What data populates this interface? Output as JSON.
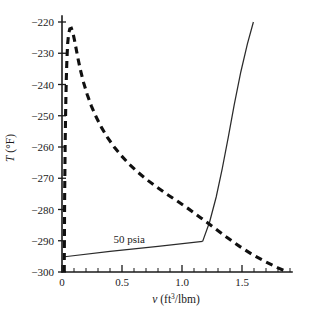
{
  "chart_data": {
    "type": "line",
    "title": "",
    "xlabel": "v (ft3/lbm)",
    "xlabel_base": "v (ft",
    "xlabel_sup": "3",
    "xlabel_tail": "/lbm)",
    "ylabel": "T (°F)",
    "xlim": [
      0,
      1.9
    ],
    "ylim": [
      -300,
      -218
    ],
    "grid": false,
    "legend": "none",
    "x_ticks_major": [
      0,
      0.5,
      1.0,
      1.5
    ],
    "x_tick_labels": [
      "0",
      "0.5",
      "1.0",
      "1.5"
    ],
    "x_tick_minor_step": 0.1,
    "y_ticks_major": [
      -220,
      -230,
      -240,
      -250,
      -260,
      -270,
      -280,
      -290,
      -300
    ],
    "y_tick_labels": [
      "−220",
      "−230",
      "−240",
      "−250",
      "−260",
      "−270",
      "−280",
      "−290",
      "−300"
    ],
    "annotations": [
      {
        "text": "50 psia",
        "x": 0.56,
        "y": -290.6
      }
    ],
    "series": [
      {
        "name": "saturation dome (saturated liquid + vapor line)",
        "style": "dashed",
        "points": [
          [
            0.019,
            -300.0
          ],
          [
            0.019,
            -296.0
          ],
          [
            0.02,
            -290.0
          ],
          [
            0.021,
            -283.0
          ],
          [
            0.022,
            -276.0
          ],
          [
            0.024,
            -268.0
          ],
          [
            0.026,
            -260.0
          ],
          [
            0.029,
            -252.0
          ],
          [
            0.032,
            -245.0
          ],
          [
            0.036,
            -238.0
          ],
          [
            0.041,
            -232.0
          ],
          [
            0.047,
            -227.0
          ],
          [
            0.055,
            -223.8
          ],
          [
            0.065,
            -222.2
          ],
          [
            0.078,
            -222.0
          ],
          [
            0.09,
            -223.3
          ],
          [
            0.103,
            -225.6
          ],
          [
            0.118,
            -228.6
          ],
          [
            0.135,
            -232.0
          ],
          [
            0.155,
            -235.6
          ],
          [
            0.18,
            -239.4
          ],
          [
            0.21,
            -243.2
          ],
          [
            0.245,
            -246.9
          ],
          [
            0.285,
            -250.4
          ],
          [
            0.33,
            -253.8
          ],
          [
            0.38,
            -257.0
          ],
          [
            0.435,
            -260.0
          ],
          [
            0.495,
            -262.8
          ],
          [
            0.56,
            -265.5
          ],
          [
            0.63,
            -268.0
          ],
          [
            0.705,
            -270.4
          ],
          [
            0.785,
            -272.7
          ],
          [
            0.87,
            -275.0
          ],
          [
            0.96,
            -277.3
          ],
          [
            1.055,
            -279.8
          ],
          [
            1.155,
            -282.6
          ],
          [
            1.26,
            -285.6
          ],
          [
            1.37,
            -288.8
          ],
          [
            1.48,
            -291.8
          ],
          [
            1.59,
            -294.5
          ],
          [
            1.7,
            -296.8
          ],
          [
            1.8,
            -298.7
          ],
          [
            1.88,
            -300.0
          ]
        ]
      },
      {
        "name": "50 psia constant-pressure line",
        "style": "solid",
        "points": [
          [
            0.022,
            -295.1
          ],
          [
            0.4,
            -293.4
          ],
          [
            0.8,
            -291.8
          ],
          [
            1.172,
            -290.2
          ]
        ]
      },
      {
        "name": "superheated vapor isobar branch",
        "style": "solid",
        "points": [
          [
            1.172,
            -290.2
          ],
          [
            1.23,
            -284.0
          ],
          [
            1.285,
            -276.0
          ],
          [
            1.335,
            -267.0
          ],
          [
            1.385,
            -257.0
          ],
          [
            1.435,
            -246.5
          ],
          [
            1.49,
            -236.0
          ],
          [
            1.545,
            -227.0
          ],
          [
            1.595,
            -220.0
          ]
        ]
      }
    ]
  }
}
